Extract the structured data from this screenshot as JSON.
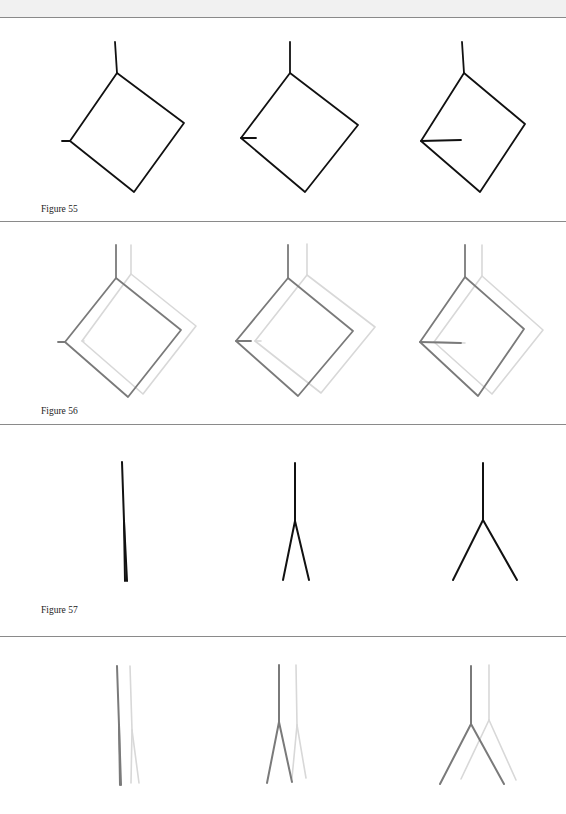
{
  "figures": [
    {
      "label": "Figure 55",
      "description": "Three rotated square diagrams with a vertical stem at the top corner and a horizontal tick at the left corner of increasing length",
      "panels": [
        {
          "stem": [
            [
              115,
              42
            ],
            [
              117,
              73
            ]
          ],
          "square": [
            [
              117,
              73
            ],
            [
              184,
              123
            ],
            [
              134,
              192
            ],
            [
              70,
              141
            ]
          ],
          "tick": [
            [
              62,
              141
            ],
            [
              70,
              141
            ]
          ],
          "color": "#111111"
        },
        {
          "stem": [
            [
              290,
              42
            ],
            [
              290,
              73
            ]
          ],
          "square": [
            [
              290,
              73
            ],
            [
              358,
              125
            ],
            [
              305,
              192
            ],
            [
              241,
              138
            ]
          ],
          "tick": [
            [
              241,
              138
            ],
            [
              256,
              138
            ]
          ],
          "color": "#111111"
        },
        {
          "stem": [
            [
              462,
              42
            ],
            [
              464,
              73
            ]
          ],
          "square": [
            [
              464,
              73
            ],
            [
              525,
              124
            ],
            [
              480,
              192
            ],
            [
              421,
              141
            ]
          ],
          "tick": [
            [
              421,
              141
            ],
            [
              461,
              140
            ]
          ],
          "color": "#111111"
        }
      ]
    },
    {
      "label": "Figure 56",
      "description": "Same three diagrams in gray, each overlaid with a lighter offset copy",
      "panels": [
        {
          "dark": {
            "stem": [
              [
                116,
                245
              ],
              [
                116,
                278
              ]
            ],
            "square": [
              [
                116,
                278
              ],
              [
                181,
                330
              ],
              [
                128,
                397
              ],
              [
                65,
                342
              ]
            ],
            "tick": [
              [
                58,
                342
              ],
              [
                65,
                342
              ]
            ]
          },
          "light": {
            "stem": [
              [
                131,
                245
              ],
              [
                131,
                274
              ]
            ],
            "square": [
              [
                131,
                274
              ],
              [
                196,
                326
              ],
              [
                143,
                394
              ],
              [
                82,
                341
              ]
            ],
            "tick": [
              [
                82,
                341
              ],
              [
                84,
                341
              ]
            ]
          }
        },
        {
          "dark": {
            "stem": [
              [
                288,
                245
              ],
              [
                288,
                278
              ]
            ],
            "square": [
              [
                288,
                278
              ],
              [
                353,
                331
              ],
              [
                298,
                396
              ],
              [
                236,
                341
              ]
            ],
            "tick": [
              [
                236,
                341
              ],
              [
                251,
                341
              ]
            ]
          },
          "light": {
            "stem": [
              [
                307,
                244
              ],
              [
                307,
                275
              ]
            ],
            "square": [
              [
                307,
                275
              ],
              [
                375,
                327
              ],
              [
                321,
                393
              ],
              [
                255,
                341
              ]
            ],
            "tick": [
              [
                255,
                341
              ],
              [
                261,
                341
              ]
            ]
          }
        },
        {
          "dark": {
            "stem": [
              [
                465,
                245
              ],
              [
                465,
                277
              ]
            ],
            "square": [
              [
                465,
                277
              ],
              [
                524,
                329
              ],
              [
                478,
                396
              ],
              [
                420,
                342
              ]
            ],
            "tick": [
              [
                420,
                342
              ],
              [
                461,
                343
              ]
            ]
          },
          "light": {
            "stem": [
              [
                482,
                245
              ],
              [
                482,
                276
              ]
            ],
            "square": [
              [
                482,
                276
              ],
              [
                543,
                330
              ],
              [
                492,
                394
              ],
              [
                434,
                342
              ]
            ],
            "tick": [
              [
                434,
                342
              ],
              [
                465,
                343
              ]
            ]
          }
        }
      ],
      "dark_color": "#7a7a7a",
      "light_color": "#d8d8d8"
    },
    {
      "label": "Figure 57",
      "description": "Three forking line diagrams: a single line, a narrow fork, and a wide fork",
      "panels": [
        {
          "stem": [
            [
              122,
              462
            ],
            [
              124,
              521
            ]
          ],
          "legs": [
            [
              [
                124,
                521
              ],
              [
                125,
                581
              ]
            ],
            [
              [
                124,
                521
              ],
              [
                127,
                581
              ]
            ]
          ],
          "color": "#111111"
        },
        {
          "stem": [
            [
              295,
              463
            ],
            [
              295,
              521
            ]
          ],
          "legs": [
            [
              [
                295,
                521
              ],
              [
                283,
                580
              ]
            ],
            [
              [
                295,
                521
              ],
              [
                309,
                580
              ]
            ]
          ],
          "color": "#111111"
        },
        {
          "stem": [
            [
              483,
              463
            ],
            [
              483,
              520
            ]
          ],
          "legs": [
            [
              [
                483,
                520
              ],
              [
                453,
                580
              ]
            ],
            [
              [
                483,
                520
              ],
              [
                517,
                580
              ]
            ]
          ],
          "color": "#111111"
        }
      ]
    },
    {
      "label": "",
      "description": "Forking line diagrams in gray overlaid with lighter offset copies",
      "panels": [
        {
          "dark": {
            "stem": [
              [
                117,
                666
              ],
              [
                119,
                725
              ]
            ],
            "legs": [
              [
                [
                  119,
                  725
                ],
                [
                  120,
                  785
                ]
              ],
              [
                [
                  119,
                  725
                ],
                [
                  121,
                  785
                ]
              ]
            ]
          },
          "light": {
            "stem": [
              [
                130,
                666
              ],
              [
                132,
                730
              ]
            ],
            "legs": [
              [
                [
                  132,
                  730
                ],
                [
                  131,
                  783
                ]
              ],
              [
                [
                  132,
                  730
                ],
                [
                  139,
                  783
                ]
              ]
            ]
          }
        },
        {
          "dark": {
            "stem": [
              [
                279,
                665
              ],
              [
                279,
                722
              ]
            ],
            "legs": [
              [
                [
                  279,
                  722
                ],
                [
                  267,
                  783
                ]
              ],
              [
                [
                  279,
                  722
                ],
                [
                  292,
                  782
                ]
              ]
            ]
          },
          "light": {
            "stem": [
              [
                296,
                665
              ],
              [
                297,
                725
              ]
            ],
            "legs": [
              [
                [
                  297,
                  725
                ],
                [
                  292,
                  778
                ]
              ],
              [
                [
                  297,
                  725
                ],
                [
                  306,
                  778
                ]
              ]
            ]
          }
        },
        {
          "dark": {
            "stem": [
              [
                471,
                666
              ],
              [
                471,
                724
              ]
            ],
            "legs": [
              [
                [
                  471,
                  724
                ],
                [
                  440,
                  784
                ]
              ],
              [
                [
                  471,
                  724
                ],
                [
                  504,
                  784
                ]
              ]
            ]
          },
          "light": {
            "stem": [
              [
                489,
                665
              ],
              [
                489,
                720
              ]
            ],
            "legs": [
              [
                [
                  489,
                  720
                ],
                [
                  461,
                  779
                ]
              ],
              [
                [
                  489,
                  720
                ],
                [
                  516,
                  780
                ]
              ]
            ]
          }
        }
      ],
      "dark_color": "#7a7a7a",
      "light_color": "#d8d8d8"
    }
  ],
  "captions": {
    "fig55": "Figure 55",
    "fig56": "Figure 56",
    "fig57": "Figure 57"
  }
}
